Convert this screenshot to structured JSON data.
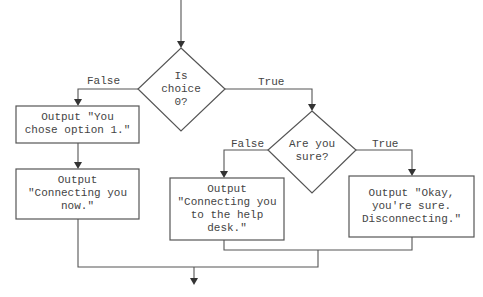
{
  "flowchart": {
    "decisions": [
      {
        "id": "d1",
        "text": "Is\nchoice\n0?"
      },
      {
        "id": "d2",
        "text": "Are you\nsure?"
      }
    ],
    "processes": [
      {
        "id": "p1",
        "text": "Output \"You\nchose option 1.\""
      },
      {
        "id": "p2",
        "text": "Output\n\"Connecting you\nnow.\""
      },
      {
        "id": "p3",
        "text": "Output\n\"Connecting you\nto the help\ndesk.\""
      },
      {
        "id": "p4",
        "text": "Output \"Okay,\nyou're sure.\nDisconnecting.\""
      }
    ],
    "edges": [
      {
        "from": "d1",
        "to": "p1",
        "label": "False"
      },
      {
        "from": "d1",
        "to": "d2",
        "label": "True"
      },
      {
        "from": "d2",
        "to": "p3",
        "label": "False"
      },
      {
        "from": "d2",
        "to": "p4",
        "label": "True"
      }
    ]
  }
}
